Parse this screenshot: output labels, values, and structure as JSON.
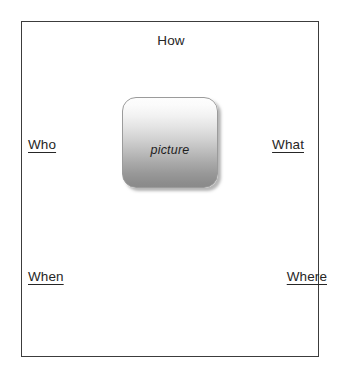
{
  "diagram": {
    "frame": {
      "border_color": "#3c3c3c",
      "background_color": "#ffffff"
    },
    "labels": {
      "how": "How",
      "who": "Who",
      "what": "What",
      "when": "When",
      "where": "Where"
    },
    "center": {
      "caption": "picture",
      "gradient_top_color": "#fdfdfd",
      "gradient_bottom_color": "#8a8a8a",
      "border_color": "#9b9b9b",
      "shadow_color": "#787878"
    },
    "text_color": "#262626"
  }
}
